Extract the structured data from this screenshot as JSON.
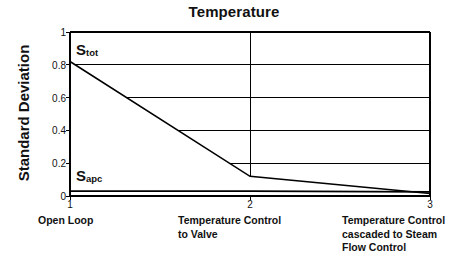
{
  "chart_data": {
    "type": "line",
    "title": "Temperature",
    "xlabel": "",
    "ylabel": "Standard Deviation",
    "grid": true,
    "legend": "in-plot annotations",
    "xlim": [
      1,
      3
    ],
    "ylim": [
      0,
      1
    ],
    "x": [
      1,
      2,
      3
    ],
    "xticklabels": [
      "1",
      "2",
      "3"
    ],
    "yticklabels": [
      "0",
      "0.2",
      "0.4",
      "0.6",
      "0.8",
      "1"
    ],
    "ytickvalues": [
      0,
      0.2,
      0.4,
      0.6,
      0.8,
      1
    ],
    "categories": [
      "Open Loop",
      "Temperature Control to Valve",
      "Temperature Control cascaded to Steam Flow Control"
    ],
    "category_lines": [
      [
        "Open Loop"
      ],
      [
        "Temperature Control",
        "to Valve"
      ],
      [
        "Temperature Control",
        "cascaded to Steam",
        "Flow Control"
      ]
    ],
    "series": [
      {
        "name": "Stot",
        "label_base": "S",
        "label_sub": "tot",
        "values": [
          0.82,
          0.12,
          0.015
        ]
      },
      {
        "name": "Sapc",
        "label_base": "S",
        "label_sub": "apc",
        "values": [
          0.03,
          0.03,
          0.025
        ]
      }
    ],
    "colors": {
      "line": "#000000",
      "grid": "#000000",
      "axis": "#000000",
      "background": "#ffffff"
    }
  },
  "annotations": {
    "stot_base": "S",
    "stot_sub": "tot",
    "sapc_base": "S",
    "sapc_sub": "apc"
  }
}
